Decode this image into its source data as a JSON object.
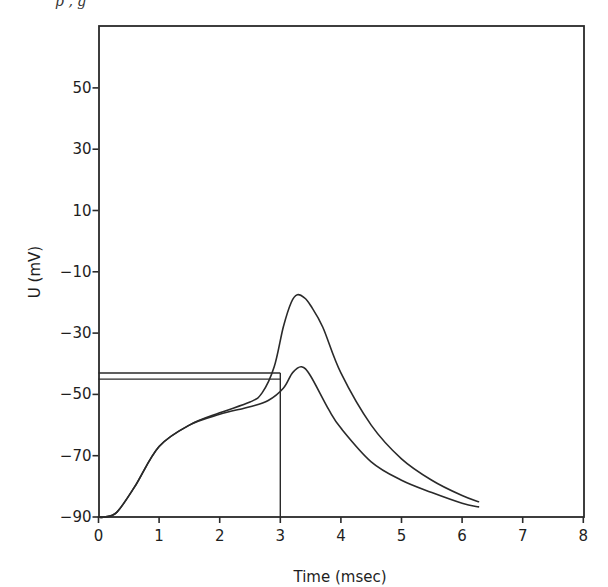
{
  "chart_data": {
    "type": "line",
    "title": "",
    "xlabel": "Time (msec)",
    "ylabel": "U (mV)",
    "xlim": [
      0,
      8
    ],
    "ylim": [
      -90,
      70
    ],
    "grid": false,
    "legend": null,
    "x_ticks": [
      0,
      1,
      2,
      3,
      4,
      5,
      6,
      7,
      8
    ],
    "x_tick_labels": [
      "0",
      "1",
      "2",
      "3",
      "4",
      "5",
      "6",
      "7",
      "8"
    ],
    "y_ticks": [
      50,
      30,
      10,
      -10,
      -30,
      -50,
      -70,
      -90
    ],
    "y_tick_labels": [
      "50",
      "30",
      "10",
      "−10",
      "−30",
      "−50",
      "−70",
      "−90"
    ],
    "series": [
      {
        "name": "upper response (action potential)",
        "x": [
          0.0,
          0.1,
          0.3,
          0.6,
          1.0,
          1.5,
          2.0,
          2.5,
          2.7,
          2.9,
          3.05,
          3.18,
          3.28,
          3.4,
          3.5,
          3.7,
          4.0,
          4.5,
          5.0,
          5.5,
          6.0,
          6.27
        ],
        "y": [
          -90,
          -90,
          -88.5,
          -80,
          -67,
          -60,
          -56,
          -52.5,
          -49.5,
          -41,
          -28,
          -20,
          -17.5,
          -18.5,
          -21,
          -28,
          -43,
          -60,
          -71,
          -78,
          -83,
          -85
        ]
      },
      {
        "name": "lower response",
        "x": [
          0.0,
          0.1,
          0.3,
          0.6,
          1.0,
          1.5,
          2.0,
          2.5,
          2.8,
          3.05,
          3.2,
          3.35,
          3.5,
          3.8,
          4.0,
          4.5,
          5.0,
          5.5,
          6.0,
          6.27
        ],
        "y": [
          -90,
          -90,
          -88.5,
          -80,
          -67,
          -60,
          -56.5,
          -54,
          -52,
          -48,
          -43,
          -41,
          -44,
          -55,
          -61,
          -72,
          -78,
          -82,
          -85.5,
          -86.7
        ]
      }
    ],
    "annotations": [
      {
        "type": "stimulus-bar",
        "x": [
          0,
          3
        ],
        "y": -43,
        "description": "upper stimulus level line"
      },
      {
        "type": "stimulus-bar",
        "x": [
          0,
          3
        ],
        "y": -45,
        "description": "lower stimulus level line"
      },
      {
        "type": "vertical-line",
        "x": 3,
        "y": [
          -90,
          -43
        ],
        "description": "stimulus end at 3 msec"
      }
    ]
  },
  "page": {
    "top_fragment": "p          ,          g"
  }
}
